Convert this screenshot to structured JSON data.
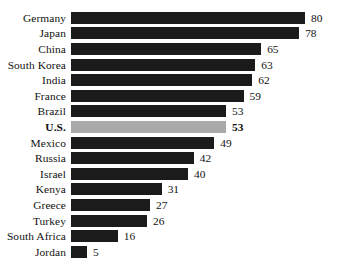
{
  "chart_data": {
    "type": "bar",
    "orientation": "horizontal",
    "title": "",
    "xlabel": "",
    "ylabel": "",
    "xlim": [
      0,
      80
    ],
    "grid": false,
    "legend": false,
    "value_labels": true,
    "colors": {
      "bar": "#1b1b1b",
      "highlight_bar": "#a9a9a9",
      "background": "#ffffff",
      "text": "#111111"
    },
    "highlight_category": "U.S.",
    "categories": [
      "Germany",
      "Japan",
      "China",
      "South Korea",
      "India",
      "France",
      "Brazil",
      "U.S.",
      "Mexico",
      "Russia",
      "Israel",
      "Kenya",
      "Greece",
      "Turkey",
      "South Africa",
      "Jordan"
    ],
    "values": [
      80,
      78,
      65,
      63,
      62,
      59,
      53,
      53,
      49,
      42,
      40,
      31,
      27,
      26,
      16,
      5
    ],
    "rows": [
      {
        "label": "Germany",
        "value": 80,
        "value_text": "80",
        "highlight": false
      },
      {
        "label": "Japan",
        "value": 78,
        "value_text": "78",
        "highlight": false
      },
      {
        "label": "China",
        "value": 65,
        "value_text": "65",
        "highlight": false
      },
      {
        "label": "South Korea",
        "value": 63,
        "value_text": "63",
        "highlight": false
      },
      {
        "label": "India",
        "value": 62,
        "value_text": "62",
        "highlight": false
      },
      {
        "label": "France",
        "value": 59,
        "value_text": "59",
        "highlight": false
      },
      {
        "label": "Brazil",
        "value": 53,
        "value_text": "53",
        "highlight": false
      },
      {
        "label": "U.S.",
        "value": 53,
        "value_text": "53",
        "highlight": true
      },
      {
        "label": "Mexico",
        "value": 49,
        "value_text": "49",
        "highlight": false
      },
      {
        "label": "Russia",
        "value": 42,
        "value_text": "42",
        "highlight": false
      },
      {
        "label": "Israel",
        "value": 40,
        "value_text": "40",
        "highlight": false
      },
      {
        "label": "Kenya",
        "value": 31,
        "value_text": "31",
        "highlight": false
      },
      {
        "label": "Greece",
        "value": 27,
        "value_text": "27",
        "highlight": false
      },
      {
        "label": "Turkey",
        "value": 26,
        "value_text": "26",
        "highlight": false
      },
      {
        "label": "South Africa",
        "value": 16,
        "value_text": "16",
        "highlight": false
      },
      {
        "label": "Jordan",
        "value": 5,
        "value_text": "5",
        "highlight": false
      }
    ]
  }
}
